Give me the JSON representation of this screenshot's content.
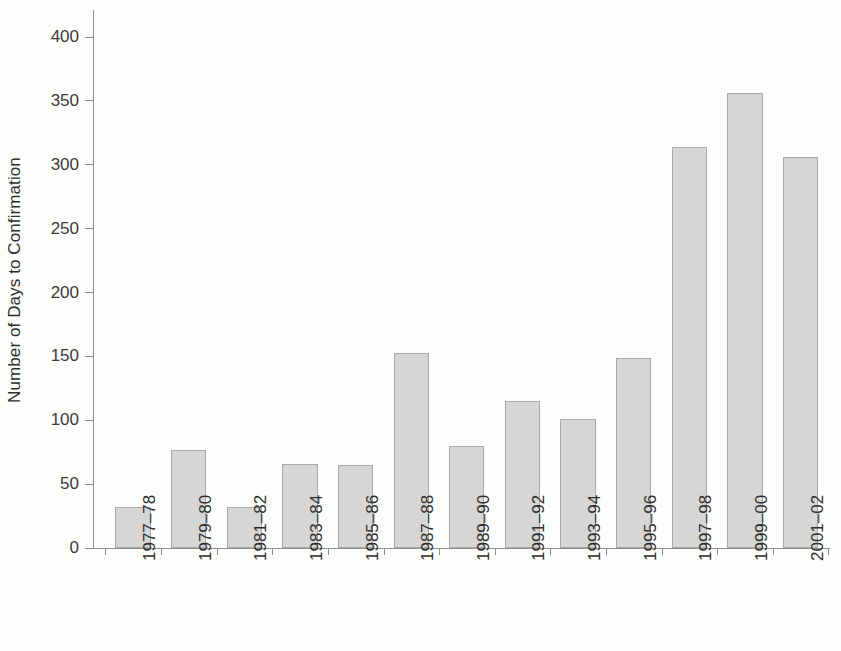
{
  "chart_data": {
    "type": "bar",
    "title": "",
    "subtitle": "",
    "xlabel": "",
    "ylabel": "Number of Days to Confirmation",
    "categories": [
      "1977–78",
      "1979–80",
      "1981–82",
      "1983–84",
      "1985–86",
      "1987–88",
      "1989–90",
      "1991–92",
      "1993–94",
      "1995–96",
      "1997–98",
      "1999–00",
      "2001–02"
    ],
    "values": [
      32,
      77,
      32,
      66,
      65,
      153,
      80,
      115,
      101,
      149,
      314,
      356,
      306
    ],
    "ylim": [
      0,
      400
    ],
    "ytick_labels": [
      "0",
      "50",
      "100",
      "150",
      "200",
      "250",
      "300",
      "350",
      "400"
    ],
    "ytick_values": [
      0,
      50,
      100,
      150,
      200,
      250,
      300,
      350,
      400
    ],
    "grid": false,
    "legend": null,
    "bar_color": "#d6d6d6",
    "bar_edge_color": "#a9a9a9",
    "axis_color": "#8e8e8e",
    "text_color": "#2e2e2e",
    "background_color": "#fdfdfc"
  }
}
